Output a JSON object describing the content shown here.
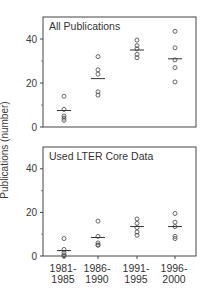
{
  "figure": {
    "ylabel": "Publications (number)",
    "categories": [
      "1981-\n1985",
      "1986-\n1990",
      "1991-\n1995",
      "1996-\n2000"
    ],
    "category_lines": [
      [
        "1981-",
        "1985"
      ],
      [
        "1986-",
        "1990"
      ],
      [
        "1991-",
        "1995"
      ],
      [
        "1996-",
        "2000"
      ]
    ]
  },
  "chart_data": [
    {
      "type": "scatter",
      "title": "All Publications",
      "xlabel": "",
      "ylabel": "Publications (number)",
      "categories": [
        "1981-1985",
        "1986-1990",
        "1991-1995",
        "1996-2000"
      ],
      "ylim": [
        0,
        50
      ],
      "yticks": [
        0,
        20,
        40
      ],
      "minor_yticks": [
        10,
        30
      ],
      "grid": false,
      "series": [
        {
          "name": "1981-1985",
          "values": [
            14,
            8,
            5,
            4,
            3
          ],
          "median": 7.5
        },
        {
          "name": "1986-1990",
          "values": [
            32,
            26,
            24,
            16,
            14.5
          ],
          "median": 22
        },
        {
          "name": "1991-1995",
          "values": [
            39.5,
            37,
            35.5,
            33,
            31.5
          ],
          "median": 35
        },
        {
          "name": "1996-2000",
          "values": [
            43.5,
            36,
            30.5,
            27,
            20.5
          ],
          "median": 31
        }
      ]
    },
    {
      "type": "scatter",
      "title": "Used LTER Core Data",
      "xlabel": "",
      "ylabel": "Publications (number)",
      "categories": [
        "1981-1985",
        "1986-1990",
        "1991-1995",
        "1996-2000"
      ],
      "ylim": [
        0,
        50
      ],
      "yticks": [
        0,
        20,
        40
      ],
      "minor_yticks": [
        10,
        30
      ],
      "grid": false,
      "series": [
        {
          "name": "1981-1985",
          "values": [
            8,
            3,
            1.5,
            0.5,
            0
          ],
          "median": 2.5
        },
        {
          "name": "1986-1990",
          "values": [
            16,
            9,
            6,
            5,
            5
          ],
          "median": 8.5
        },
        {
          "name": "1991-1995",
          "values": [
            17,
            15,
            13,
            11,
            9.5
          ],
          "median": 13.5
        },
        {
          "name": "1996-2000",
          "values": [
            19.5,
            15.5,
            13.5,
            9,
            8
          ],
          "median": 13.5
        }
      ]
    }
  ]
}
